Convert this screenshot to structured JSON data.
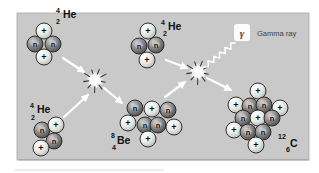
{
  "figure": {
    "width": 319,
    "height": 173,
    "panel": {
      "x": 17,
      "y": 13,
      "w": 292,
      "h": 147,
      "bg": "#c9c9c9",
      "edge": "#a8a8a8",
      "shadow": "#9a9a9a"
    },
    "colors": {
      "proton_hi": "#ffffff",
      "proton_mid": "#e8e8e3",
      "proton_dark": "#b2b2ac",
      "neutron_hi": "#d2d2d2",
      "neutron_mid": "#8e8e8e",
      "neutron_dark": "#474747",
      "particle_edge": "#1f1f1f",
      "sign_color": "#0d0d0d",
      "label_color": "#111111",
      "arrow": "#ffffff",
      "flash_ray_dark": "#3c3c3c",
      "gamma_symbol_color": "#6b4036",
      "gamma_text_color": "#3f3f3f"
    },
    "particle_legend": {
      "proton": "+",
      "neutron": "n"
    },
    "nuclei": [
      {
        "name": "helium-4-top-left",
        "symbol": "He",
        "mass": "4",
        "atomic": "2",
        "label": {
          "mx": 56,
          "my": 13,
          "ax": 56,
          "ay": 24,
          "sx": 63,
          "sy": 18
        },
        "particles": [
          {
            "t": "p",
            "x": 44,
            "y": 31
          },
          {
            "t": "n",
            "x": 35,
            "y": 44
          },
          {
            "t": "n",
            "x": 53,
            "y": 44
          },
          {
            "t": "p",
            "x": 44,
            "y": 57
          }
        ]
      },
      {
        "name": "helium-4-top-center",
        "symbol": "He",
        "mass": "4",
        "atomic": "2",
        "label": {
          "mx": 161,
          "my": 25,
          "ax": 163,
          "ay": 36,
          "sx": 168,
          "sy": 30
        },
        "particles": [
          {
            "t": "p",
            "x": 148,
            "y": 31
          },
          {
            "t": "n",
            "x": 139,
            "y": 46
          },
          {
            "t": "n",
            "x": 156,
            "y": 45
          },
          {
            "t": "p",
            "x": 147,
            "y": 60
          }
        ]
      },
      {
        "name": "helium-4-bottom-left",
        "symbol": "He",
        "mass": "4",
        "atomic": "2",
        "label": {
          "mx": 30,
          "my": 108,
          "ax": 31,
          "ay": 120,
          "sx": 37,
          "sy": 113
        },
        "particles": [
          {
            "t": "n",
            "x": 42,
            "y": 130
          },
          {
            "t": "p",
            "x": 56,
            "y": 125
          },
          {
            "t": "n",
            "x": 54,
            "y": 141
          },
          {
            "t": "p",
            "x": 41,
            "y": 148
          }
        ]
      },
      {
        "name": "beryllium-8",
        "symbol": "Be",
        "mass": "8",
        "atomic": "4",
        "label": {
          "mx": 111,
          "my": 138,
          "ax": 112,
          "ay": 150,
          "sx": 117,
          "sy": 144
        },
        "particles": [
          {
            "t": "n",
            "x": 135,
            "y": 108
          },
          {
            "t": "p",
            "x": 152,
            "y": 109
          },
          {
            "t": "n",
            "x": 168,
            "y": 110
          },
          {
            "t": "p",
            "x": 128,
            "y": 123
          },
          {
            "t": "n",
            "x": 145,
            "y": 125
          },
          {
            "t": "n",
            "x": 158,
            "y": 125
          },
          {
            "t": "p",
            "x": 174,
            "y": 127
          },
          {
            "t": "p",
            "x": 148,
            "y": 139
          }
        ]
      },
      {
        "name": "carbon-12",
        "symbol": "C",
        "mass": "12",
        "atomic": "6",
        "label": {
          "mx": 278,
          "my": 139,
          "ax": 286,
          "ay": 152,
          "sx": 290,
          "sy": 147
        },
        "particles": [
          {
            "t": "p",
            "x": 258,
            "y": 91
          },
          {
            "t": "p",
            "x": 236,
            "y": 105
          },
          {
            "t": "n",
            "x": 250,
            "y": 106
          },
          {
            "t": "n",
            "x": 264,
            "y": 105
          },
          {
            "t": "p",
            "x": 280,
            "y": 108
          },
          {
            "t": "n",
            "x": 243,
            "y": 118
          },
          {
            "t": "p",
            "x": 258,
            "y": 118
          },
          {
            "t": "n",
            "x": 272,
            "y": 118
          },
          {
            "t": "p",
            "x": 234,
            "y": 130
          },
          {
            "t": "n",
            "x": 248,
            "y": 132
          },
          {
            "t": "n",
            "x": 263,
            "y": 132
          },
          {
            "t": "p",
            "x": 256,
            "y": 145
          }
        ]
      }
    ],
    "starbursts": [
      {
        "x": 95,
        "y": 80
      },
      {
        "x": 198,
        "y": 72
      }
    ],
    "arrows": [
      {
        "x1": 63,
        "y1": 58,
        "x2": 84,
        "y2": 72
      },
      {
        "x1": 64,
        "y1": 117,
        "x2": 88,
        "y2": 95
      },
      {
        "x1": 104,
        "y1": 88,
        "x2": 122,
        "y2": 103
      },
      {
        "x1": 166,
        "y1": 60,
        "x2": 187,
        "y2": 68
      },
      {
        "x1": 165,
        "y1": 97,
        "x2": 185,
        "y2": 82
      },
      {
        "x1": 207,
        "y1": 78,
        "x2": 231,
        "y2": 90
      }
    ],
    "gamma": {
      "symbol": "γ",
      "label": "Gamma ray",
      "squiggle": {
        "x1": 204,
        "y1": 67,
        "x2": 235,
        "y2": 43
      },
      "glow": {
        "x": 234,
        "y": 24,
        "w": 16,
        "h": 17
      },
      "symbol_pos": {
        "x": 242,
        "y": 37
      },
      "label_pos": {
        "x": 257,
        "y": 36
      }
    }
  }
}
